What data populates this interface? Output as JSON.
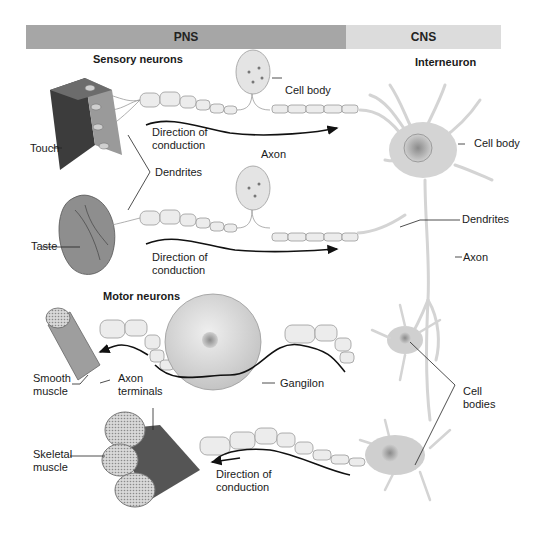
{
  "header": {
    "pns_label": "PNS",
    "cns_label": "CNS",
    "pns_color": "#a6a6a6",
    "cns_color": "#dcdcdc"
  },
  "sections": {
    "sensory_title": "Sensory neurons",
    "motor_title": "Motor neurons",
    "interneuron_title": "Interneuron"
  },
  "labels": {
    "touch": "Touch",
    "taste": "Taste",
    "dendrites_sensory": "Dendrites",
    "cell_body_sensory": "Cell body",
    "direction_1_line1": "Direction of",
    "direction_1_line2": "conduction",
    "direction_2_line1": "Direction of",
    "direction_2_line2": "conduction",
    "axon_sensory": "Axon",
    "cell_body_interneuron": "Cell body",
    "dendrites_interneuron": "Dendrites",
    "axon_interneuron": "Axon",
    "smooth_muscle_line1": "Smooth",
    "smooth_muscle_line2": "muscle",
    "axon_terminals_line1": "Axon",
    "axon_terminals_line2": "terminals",
    "ganglion": "Gangilon",
    "cell_bodies_line1": "Cell",
    "cell_bodies_line2": "bodies",
    "skeletal_muscle_line1": "Skeletal",
    "skeletal_muscle_line2": "muscle",
    "direction_3_line1": "Direction of",
    "direction_3_line2": "conduction"
  }
}
